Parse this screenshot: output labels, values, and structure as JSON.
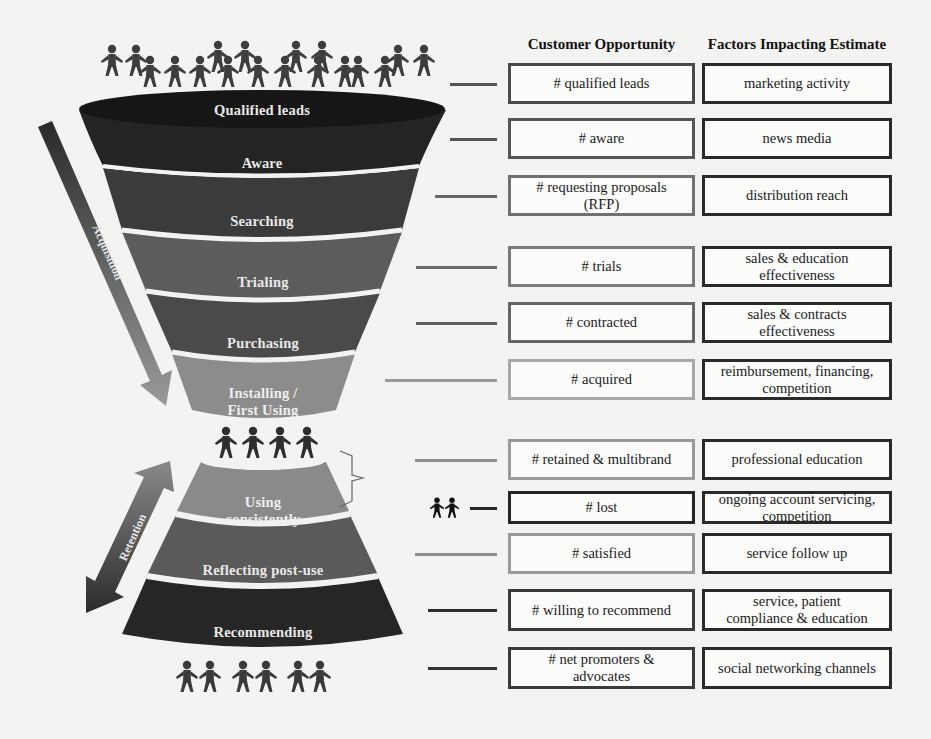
{
  "headers": {
    "customer_opportunity": "Customer Opportunity",
    "factors_impacting_estimate": "Factors Impacting Estimate"
  },
  "funnel": {
    "stages": [
      {
        "label": "Qualified leads",
        "color": "#1c1c1c"
      },
      {
        "label": "Aware",
        "color": "#242424"
      },
      {
        "label": "Searching",
        "color": "#3b3b3b"
      },
      {
        "label": "Trialing",
        "color": "#5c5c5c"
      },
      {
        "label": "Purchasing",
        "color": "#4a4a4a"
      },
      {
        "label": "Installing /\nFirst Using",
        "color": "#8c8c8c"
      },
      {
        "label": "Using\nconsistently",
        "color": "#8a8a8a"
      },
      {
        "label": "Reflecting post-use",
        "color": "#5a5a5a"
      },
      {
        "label": "Recommending",
        "color": "#262626"
      }
    ],
    "acquisition_label": "Acquisition",
    "retention_label": "Retention"
  },
  "rows": [
    {
      "opportunity": "# qualified leads",
      "factor": "marketing activity",
      "opp_border": "#4a4a4a",
      "line_color": "#555555"
    },
    {
      "opportunity": "# aware",
      "factor": "news media",
      "opp_border": "#555555",
      "line_color": "#555555"
    },
    {
      "opportunity": "# requesting proposals\n(RFP)",
      "factor": "distribution reach",
      "opp_border": "#707070",
      "line_color": "#666666"
    },
    {
      "opportunity": "# trials",
      "factor": "sales & education\neffectiveness",
      "opp_border": "#7a7a7a",
      "line_color": "#6a6a6a"
    },
    {
      "opportunity": "# contracted",
      "factor": "sales & contracts\neffectiveness",
      "opp_border": "#666666",
      "line_color": "#5e5e5e"
    },
    {
      "opportunity": "# acquired",
      "factor": "reimbursement, financing,\ncompetition",
      "opp_border": "#a8a8a8",
      "line_color": "#999999"
    },
    {
      "opportunity": "# retained & multibrand",
      "factor": "professional education",
      "opp_border": "#9a9a9a",
      "line_color": "#8e8e8e"
    },
    {
      "opportunity": "# lost",
      "factor": "ongoing account servicing,\ncompetition",
      "opp_border": "#262626",
      "line_color": "#262626"
    },
    {
      "opportunity": "# satisfied",
      "factor": "service follow up",
      "opp_border": "#9a9a9a",
      "line_color": "#8e8e8e"
    },
    {
      "opportunity": "# willing to recommend",
      "factor": "service, patient\ncompliance & education",
      "opp_border": "#3a3a3a",
      "line_color": "#2e2e2e"
    },
    {
      "opportunity": "# net promoters &\nadvocates",
      "factor": "social networking channels",
      "opp_border": "#3a3a3a",
      "line_color": "#333333"
    }
  ],
  "colors": {
    "factor_border": "#2a2a2a",
    "people": "#3a3a3a",
    "lost_people": "#111111"
  }
}
